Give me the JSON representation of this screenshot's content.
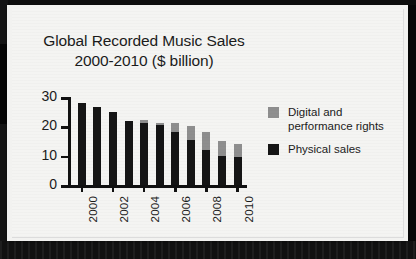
{
  "chart_data": {
    "type": "bar",
    "title": "Global Recorded Music Sales 2000-2010 ($ billion)",
    "title_lines": [
      "Global Recorded Music Sales",
      "2000-2010 ($ billion)"
    ],
    "xlabel": "",
    "ylabel": "",
    "ylim": [
      0,
      30
    ],
    "yticks": [
      0,
      10,
      20,
      30
    ],
    "ytick_labels": [
      "0",
      "10",
      "20",
      "30"
    ],
    "grid": false,
    "stacked": true,
    "legend_position": "right",
    "categories": [
      2000,
      2001,
      2002,
      2003,
      2004,
      2005,
      2006,
      2007,
      2008,
      2009,
      2010
    ],
    "xtick_labels": [
      "2000",
      "2002",
      "2004",
      "2006",
      "2008",
      "2010"
    ],
    "series": [
      {
        "name": "Physical sales",
        "color": "#151515",
        "values": [
          27.8,
          26.5,
          25,
          21.7,
          21.2,
          20.3,
          18,
          15.3,
          12,
          10,
          9.5
        ]
      },
      {
        "name": "Digital and performance rights",
        "color": "#8e8e8e",
        "values": [
          0,
          0,
          0,
          0,
          1,
          1,
          3.2,
          4.8,
          6,
          5,
          4.5
        ]
      }
    ],
    "totals": [
      27.8,
      26.5,
      25,
      21.7,
      22.2,
      21.3,
      21.2,
      20.1,
      18,
      15,
      14
    ]
  },
  "legend": {
    "entries": [
      {
        "label_line1": "Digital and",
        "label_line2": "performance rights",
        "swatch": "digital-swatch"
      },
      {
        "label_line1": "Physical sales",
        "label_line2": "",
        "swatch": "physical-swatch"
      }
    ]
  },
  "colors": {
    "physical": "#151515",
    "digital": "#8e8e8e",
    "card_background": "#f4f4f2",
    "text": "#1b1b1b",
    "axis": "#111111"
  }
}
